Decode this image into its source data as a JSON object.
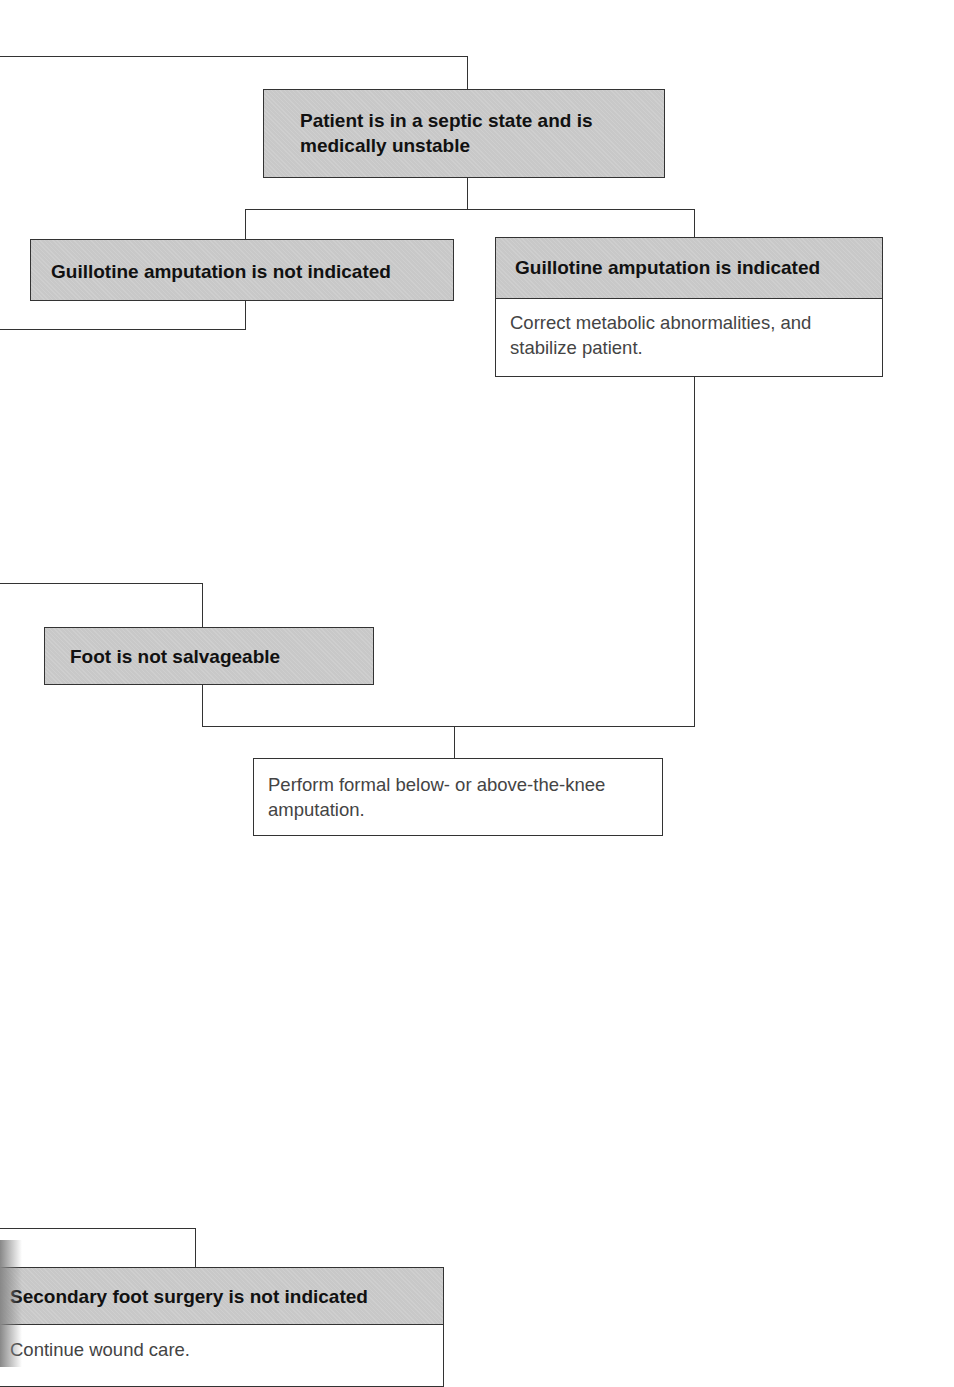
{
  "flowchart": {
    "nodes": {
      "septic": {
        "title": "Patient is in a septic state and is medically unstable"
      },
      "guillotine_not": {
        "title": "Guillotine amputation is not indicated"
      },
      "guillotine_yes": {
        "title": "Guillotine amputation is indicated",
        "body": "Correct metabolic abnormalities, and stabilize patient."
      },
      "foot_not_salvageable": {
        "title": "Foot is not salvageable"
      },
      "formal_amputation": {
        "body": "Perform formal below- or above-the-knee amputation."
      },
      "secondary_not": {
        "title": "Secondary foot surgery is not indicated",
        "body": "Continue wound care."
      }
    },
    "colors": {
      "box_fill": "#c8c8c8",
      "line": "#333333",
      "title_text": "#111111",
      "body_text": "#444444"
    }
  }
}
